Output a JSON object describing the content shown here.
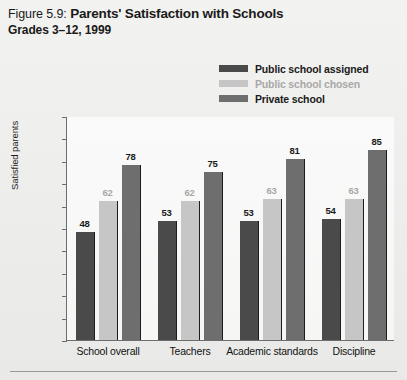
{
  "figure": {
    "number": "Figure 5.9:",
    "title": "Parents' Satisfaction with Schools",
    "subtitle": "Grades 3–12, 1999"
  },
  "legend": {
    "position": "top-right",
    "items": [
      {
        "label": "Public school assigned",
        "color": "#4a4a4a",
        "text_color": "#1a1a1a"
      },
      {
        "label": "Public school chosen",
        "color": "#c6c6c6",
        "text_color": "#a8a8a8"
      },
      {
        "label": "Private school",
        "color": "#6e6e6e",
        "text_color": "#1a1a1a"
      }
    ]
  },
  "yaxis": {
    "title": "Satisfied parents",
    "ticks": [
      "100%",
      "90%",
      "80%",
      "70%",
      "60%",
      "50%",
      "40%",
      "30%",
      "20%",
      "10%",
      "0"
    ]
  },
  "chart_data": {
    "type": "bar",
    "title": "Parents' Satisfaction with Schools",
    "subtitle": "Grades 3–12, 1999",
    "xlabel": "",
    "ylabel": "Satisfied parents",
    "ylim": [
      0,
      100
    ],
    "yticks": [
      0,
      10,
      20,
      30,
      40,
      50,
      60,
      70,
      80,
      90,
      100
    ],
    "ytick_labels": [
      "0",
      "10%",
      "20%",
      "30%",
      "40%",
      "50%",
      "60%",
      "70%",
      "80%",
      "90%",
      "100%"
    ],
    "grid": false,
    "legend_position": "top-right",
    "categories": [
      "School overall",
      "Teachers",
      "Academic standards",
      "Discipline"
    ],
    "series": [
      {
        "name": "Public school assigned",
        "color": "#4a4a4a",
        "values": [
          48,
          53,
          53,
          54
        ],
        "labels": [
          "48",
          "53",
          "53",
          "54"
        ],
        "label_color": "#1a1a1a"
      },
      {
        "name": "Public school chosen",
        "color": "#c6c6c6",
        "values": [
          62,
          62,
          63,
          63
        ],
        "labels": [
          "62",
          "62",
          "63",
          "63"
        ],
        "label_color": "#a8a8a8"
      },
      {
        "name": "Private school",
        "color": "#6e6e6e",
        "values": [
          78,
          75,
          81,
          85
        ],
        "labels": [
          "78",
          "75",
          "81",
          "85"
        ],
        "label_color": "#1a1a1a"
      }
    ]
  }
}
